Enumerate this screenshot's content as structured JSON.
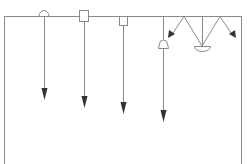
{
  "diagram": {
    "type": "lighting-fixture-schematic",
    "colors": {
      "line": "#8a8a8a",
      "arrow": "#333333",
      "background": "#ffffff"
    },
    "frame": {
      "top_y": 16,
      "left_x": 4,
      "right_x": 241,
      "bottom_y": 164
    },
    "fixtures": [
      {
        "id": "dome-ceiling-light",
        "shape": "dome",
        "x": 44,
        "arrow_end_y": 100
      },
      {
        "id": "square-surface-light",
        "shape": "square",
        "x": 84,
        "arrow_end_y": 110
      },
      {
        "id": "recessed-box-light",
        "shape": "box-hanging",
        "x": 123,
        "arrow_end_y": 115
      },
      {
        "id": "bell-pendant-light",
        "shape": "bell",
        "x": 163,
        "arrow_end_y": 122
      },
      {
        "id": "bowl-pendant-light",
        "shape": "bowl",
        "x": 202,
        "bowl_y": 48
      }
    ],
    "diagonal_arrows": [
      {
        "from": [
          184,
          16
        ],
        "to": [
          170,
          37
        ]
      },
      {
        "from": [
          220,
          16
        ],
        "to": [
          234,
          37
        ]
      }
    ]
  }
}
